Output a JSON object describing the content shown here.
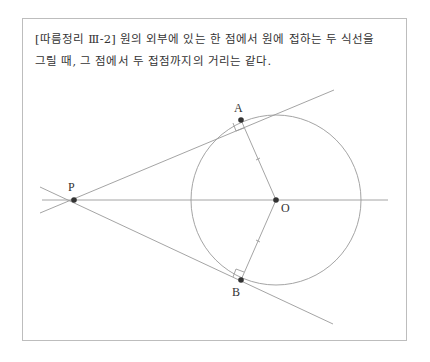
{
  "caption": {
    "line1": "[따름정리 Ⅲ-2]  원의 외부에 있는 한 점에서 원에 접하는 두 식선을",
    "line2": "그릴 때, 그 점에서 두 접점까지의 거리는 같다."
  },
  "diagram": {
    "points": [
      {
        "name": "P",
        "label": "P"
      },
      {
        "name": "A",
        "label": "A"
      },
      {
        "name": "O",
        "label": "O"
      },
      {
        "name": "B",
        "label": "B"
      }
    ]
  }
}
